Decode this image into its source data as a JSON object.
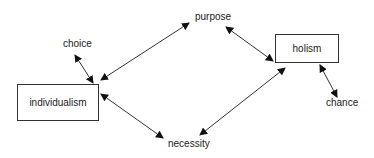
{
  "diagram": {
    "nodes": [
      {
        "id": "individualism",
        "label": "individualism",
        "shape": "box"
      },
      {
        "id": "holism",
        "label": "holism",
        "shape": "box"
      },
      {
        "id": "choice",
        "label": "choice",
        "shape": "text"
      },
      {
        "id": "purpose",
        "label": "purpose",
        "shape": "text"
      },
      {
        "id": "necessity",
        "label": "necessity",
        "shape": "text"
      },
      {
        "id": "chance",
        "label": "chance",
        "shape": "text"
      }
    ],
    "edges": [
      {
        "from": "choice",
        "to": "individualism",
        "type": "bidirectional"
      },
      {
        "from": "purpose",
        "to": "individualism",
        "type": "bidirectional"
      },
      {
        "from": "individualism",
        "to": "necessity",
        "type": "bidirectional"
      },
      {
        "from": "purpose",
        "to": "holism",
        "type": "bidirectional"
      },
      {
        "from": "necessity",
        "to": "holism",
        "type": "bidirectional"
      },
      {
        "from": "holism",
        "to": "chance",
        "type": "bidirectional"
      }
    ],
    "colors": {
      "line": "#333333",
      "text": "#222222",
      "background": "#ffffff"
    }
  }
}
